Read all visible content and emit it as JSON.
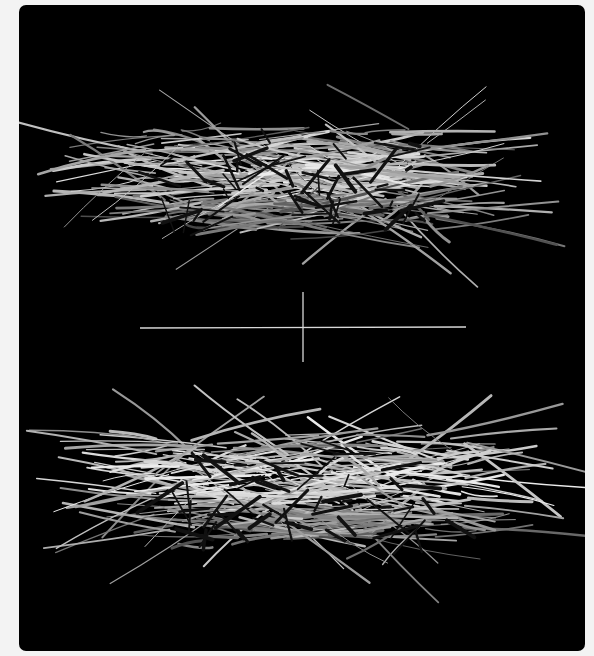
{
  "image": {
    "description": "Two bird nests made of twigs photographed on a black background, separated by a thin white crosshair",
    "background_color": "#f3f3f3",
    "panel_color": "#000000",
    "crosshair_color": "#d8d8d8",
    "subjects": [
      {
        "name": "upper-nest",
        "bbox": [
          92,
          60,
          480,
          285
        ]
      },
      {
        "name": "lower-nest",
        "bbox": [
          105,
          385,
          520,
          605
        ]
      }
    ],
    "crosshair": {
      "horizontal": [
        140,
        328,
        466,
        328
      ],
      "vertical": [
        303,
        292,
        303,
        362
      ]
    }
  }
}
